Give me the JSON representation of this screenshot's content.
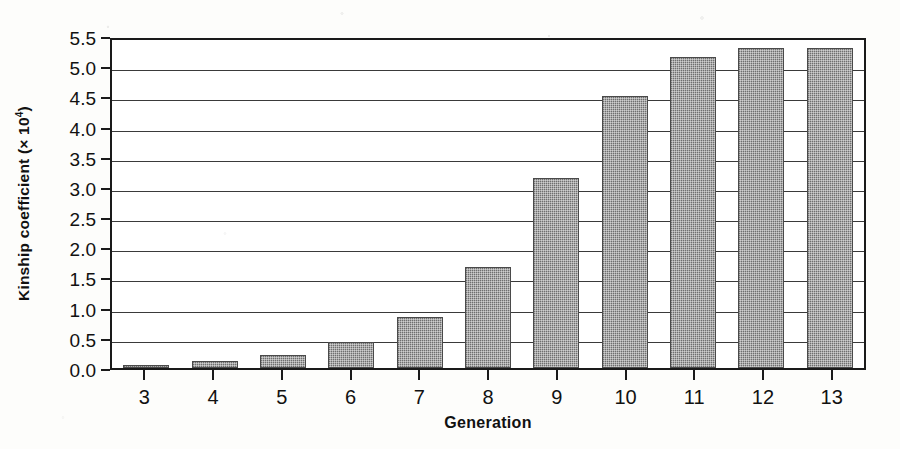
{
  "chart_data": {
    "type": "bar",
    "title": "",
    "xlabel": "Generation",
    "ylabel": "Kinship coefficient (× 10⁴)",
    "ylabel_text": "Kinship coefficient (× 10",
    "ylabel_exponent": "4",
    "ylabel_close": ")",
    "categories": [
      "3",
      "4",
      "5",
      "6",
      "7",
      "8",
      "9",
      "10",
      "11",
      "12",
      "13"
    ],
    "values": [
      0.05,
      0.11,
      0.22,
      0.43,
      0.85,
      1.67,
      3.15,
      4.5,
      5.15,
      5.3,
      5.3
    ],
    "ylim": [
      0.0,
      5.5
    ],
    "ytick_labels": [
      "0.0",
      "0.5",
      "1.0",
      "1.5",
      "2.0",
      "2.5",
      "3.0",
      "3.5",
      "4.0",
      "4.5",
      "5.0",
      "5.5"
    ],
    "ytick_values": [
      0.0,
      0.5,
      1.0,
      1.5,
      2.0,
      2.5,
      3.0,
      3.5,
      4.0,
      4.5,
      5.0,
      5.5
    ],
    "grid": true,
    "grid_axis": "y",
    "legend": "none",
    "bar_color": "#6f6f6f",
    "bar_edge_color": "#4a4a4a",
    "axis_color": "#1a1a1a",
    "background_color": "#ffffff",
    "page_background_color": "#fdfdfb"
  }
}
